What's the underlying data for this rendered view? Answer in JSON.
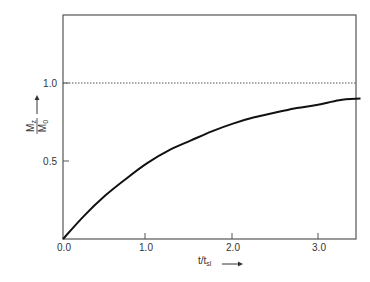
{
  "chart_data": {
    "type": "line",
    "title": "",
    "xlabel": "t/t_sl",
    "xlabel_main": "t/t",
    "xlabel_sub": "sl",
    "ylabel": "Mz/M0",
    "ylabel_num_main": "M",
    "ylabel_num_sub": "z",
    "ylabel_den_main": "M",
    "ylabel_den_sub": "0",
    "xlim": [
      0,
      3.5
    ],
    "ylim": [
      0,
      1.43
    ],
    "x_ticks": [
      "0.0",
      "1.0",
      "2.0",
      "3.0"
    ],
    "y_ticks": [
      "0.5",
      "1.0"
    ],
    "grid": false,
    "series": [
      {
        "name": "Mz/M0 recovery",
        "style": "solid",
        "x": [
          0.0,
          0.25,
          0.5,
          0.75,
          1.0,
          1.25,
          1.5,
          1.75,
          2.0,
          2.25,
          2.5,
          2.75,
          3.0,
          3.25,
          3.5
        ],
        "values": [
          0.0,
          0.15,
          0.28,
          0.39,
          0.49,
          0.57,
          0.63,
          0.69,
          0.74,
          0.78,
          0.81,
          0.84,
          0.86,
          0.89,
          0.9
        ]
      },
      {
        "name": "asymptote",
        "style": "dotted",
        "x": [
          0.0,
          3.5
        ],
        "values": [
          1.0,
          1.0
        ]
      }
    ],
    "colors": {
      "curve": "#111111",
      "axis": "#555555",
      "asymptote": "#555555"
    }
  }
}
